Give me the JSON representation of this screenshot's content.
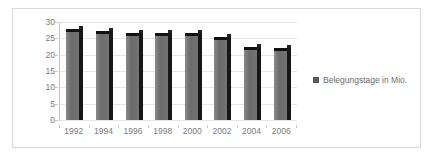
{
  "chart_data": {
    "type": "bar",
    "title": "",
    "subtitle": "",
    "xlabel": "",
    "ylabel": "",
    "categories": [
      "1992",
      "1994",
      "1996",
      "1998",
      "2000",
      "2002",
      "2004",
      "2006"
    ],
    "series": [
      {
        "name": "Belegungstage in Mio.",
        "values": [
          27.0,
          26.3,
          25.7,
          25.7,
          25.6,
          24.4,
          21.5,
          21.0
        ]
      }
    ],
    "values": [
      27.0,
      26.3,
      25.7,
      25.7,
      25.6,
      24.4,
      21.5,
      21.0
    ],
    "ylim": [
      0,
      30
    ],
    "yticks": [
      0,
      5,
      10,
      15,
      20,
      25,
      30
    ],
    "ytick_labels": [
      "0",
      "5",
      "10",
      "15",
      "20",
      "25",
      "30"
    ],
    "grid": true,
    "legend_position": "right",
    "legend_entries": [
      "Belegungstage in Mio."
    ],
    "annotations": []
  },
  "legend": {
    "label": "Belegungstage in Mio.",
    "swatch_color": "#595959"
  },
  "colors": {
    "bar_front": "#6e6e6e",
    "bar_side": "#17171a",
    "bar_top": "#111113",
    "gridline": "#e6e6e6",
    "axis_line": "#c8c8c8",
    "axis_text": "#7a7a7a",
    "frame_border": "#d9d9d9",
    "background": "#ffffff"
  }
}
